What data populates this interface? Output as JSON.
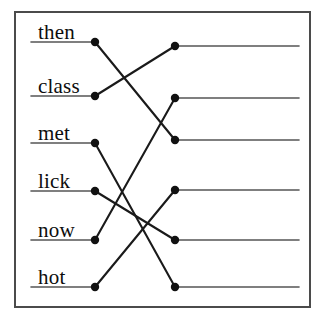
{
  "figure": {
    "kind": "matching-exercise",
    "border_color": "#4b4b4b",
    "background_color": "#ffffff",
    "line_color": "#1a1a1a",
    "dot_color": "#111111",
    "rule_color": "#555555"
  },
  "left_column": {
    "name": "left-words",
    "rule_start_x": 31,
    "dot_x": 95,
    "items": [
      {
        "id": "L1",
        "label": "then",
        "y": 42,
        "label_x": 38,
        "label_y": 22
      },
      {
        "id": "L2",
        "label": "class",
        "y": 96,
        "label_x": 38,
        "label_y": 76
      },
      {
        "id": "L3",
        "label": "met",
        "y": 143,
        "label_x": 38,
        "label_y": 123
      },
      {
        "id": "L4",
        "label": "lick",
        "y": 191,
        "label_x": 38,
        "label_y": 171
      },
      {
        "id": "L5",
        "label": "now",
        "y": 240,
        "label_x": 38,
        "label_y": 220
      },
      {
        "id": "L6",
        "label": "hot",
        "y": 287,
        "label_x": 38,
        "label_y": 267
      }
    ]
  },
  "right_column": {
    "name": "right-blanks",
    "dot_x": 175,
    "rule_end_x": 299,
    "items": [
      {
        "id": "R1",
        "label": "",
        "y": 46
      },
      {
        "id": "R2",
        "label": "",
        "y": 98
      },
      {
        "id": "R3",
        "label": "",
        "y": 140
      },
      {
        "id": "R4",
        "label": "",
        "y": 190
      },
      {
        "id": "R5",
        "label": "",
        "y": 240
      },
      {
        "id": "R6",
        "label": "",
        "y": 287
      }
    ]
  },
  "connections": [
    {
      "from": "L1",
      "from_label": "then",
      "to": "R3",
      "x1": 95,
      "y1": 42,
      "x2": 175,
      "y2": 140
    },
    {
      "from": "L2",
      "from_label": "class",
      "to": "R1",
      "x1": 95,
      "y1": 96,
      "x2": 175,
      "y2": 46
    },
    {
      "from": "L3",
      "from_label": "met",
      "to": "R6",
      "x1": 95,
      "y1": 143,
      "x2": 175,
      "y2": 287
    },
    {
      "from": "L4",
      "from_label": "lick",
      "to": "R5",
      "x1": 95,
      "y1": 191,
      "x2": 175,
      "y2": 240
    },
    {
      "from": "L5",
      "from_label": "now",
      "to": "R2",
      "x1": 95,
      "y1": 240,
      "x2": 175,
      "y2": 98
    },
    {
      "from": "L6",
      "from_label": "hot",
      "to": "R4",
      "x1": 95,
      "y1": 287,
      "x2": 175,
      "y2": 190
    }
  ]
}
